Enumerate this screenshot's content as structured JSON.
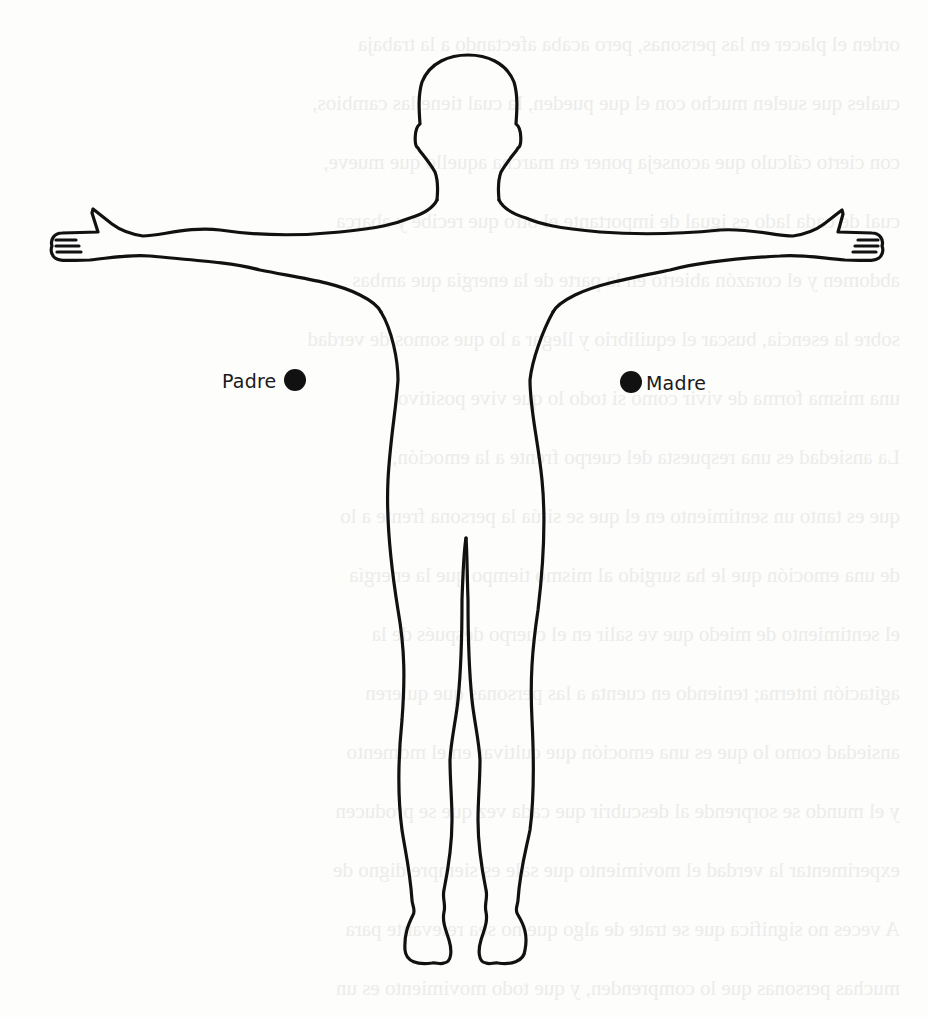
{
  "figure": {
    "stroke_color": "#111111",
    "points": [
      {
        "id": "padre",
        "label": "Padre",
        "side": "left"
      },
      {
        "id": "madre",
        "label": "Madre",
        "side": "right"
      }
    ]
  },
  "background": {
    "show_through_text": "(texto del reverso apenas visible)"
  }
}
